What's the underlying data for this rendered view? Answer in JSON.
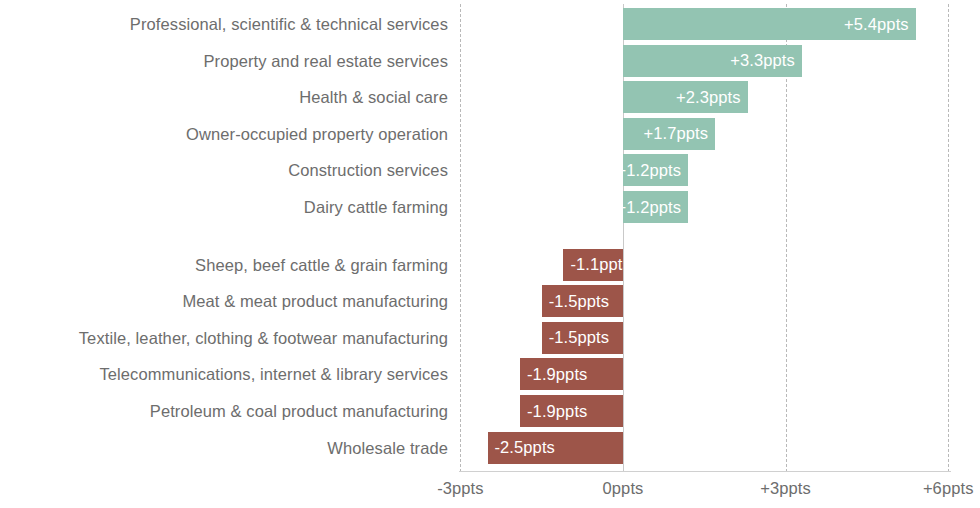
{
  "chart_data": {
    "type": "bar",
    "orientation": "horizontal",
    "title": "",
    "subtitle": "",
    "xlabel": "",
    "ylabel": "",
    "xlim": [
      -3.6,
      6.6
    ],
    "grid": true,
    "gridlines_style": "dashed",
    "legend": "none",
    "units": "ppts",
    "value_label_format": "{+}{v}ppts",
    "axis_ticks": [
      {
        "value": -3,
        "label": "-3ppts"
      },
      {
        "value": 0,
        "label": "0ppts"
      },
      {
        "value": 3,
        "label": "+3ppts"
      },
      {
        "value": 6,
        "label": "+6ppts"
      }
    ],
    "groups": [
      {
        "name": "positive",
        "color": "#93c4b2",
        "items": [
          {
            "category": "Professional, scientific & technical services",
            "value": 5.4,
            "label": "+5.4ppts"
          },
          {
            "category": "Property and real estate services",
            "value": 3.3,
            "label": "+3.3ppts"
          },
          {
            "category": "Health & social care",
            "value": 2.3,
            "label": "+2.3ppts"
          },
          {
            "category": "Owner-occupied property operation",
            "value": 1.7,
            "label": "+1.7ppts"
          },
          {
            "category": "Construction services",
            "value": 1.2,
            "label": "+1.2ppts"
          },
          {
            "category": "Dairy cattle farming",
            "value": 1.2,
            "label": "+1.2ppts"
          }
        ]
      },
      {
        "name": "negative",
        "color": "#9d5549",
        "items": [
          {
            "category": "Sheep, beef cattle & grain farming",
            "value": -1.1,
            "label": "-1.1ppts"
          },
          {
            "category": "Meat & meat product manufacturing",
            "value": -1.5,
            "label": "-1.5ppts"
          },
          {
            "category": "Textile, leather, clothing & footwear manufacturing",
            "value": -1.5,
            "label": "-1.5ppts"
          },
          {
            "category": "Telecommunications, internet & library services",
            "value": -1.9,
            "label": "-1.9ppts"
          },
          {
            "category": "Petroleum & coal product manufacturing",
            "value": -1.9,
            "label": "-1.9ppts"
          },
          {
            "category": "Wholesale trade",
            "value": -2.5,
            "label": "-2.5ppts"
          }
        ]
      }
    ],
    "categories": [
      "Professional, scientific & technical services",
      "Property and real estate services",
      "Health & social care",
      "Owner-occupied property operation",
      "Construction services",
      "Dairy cattle farming",
      "Sheep, beef cattle & grain farming",
      "Meat & meat product manufacturing",
      "Textile, leather, clothing & footwear manufacturing",
      "Telecommunications, internet & library services",
      "Petroleum & coal product manufacturing",
      "Wholesale trade"
    ],
    "values": [
      5.4,
      3.3,
      2.3,
      1.7,
      1.2,
      1.2,
      -1.1,
      -1.5,
      -1.5,
      -1.9,
      -1.9,
      -2.5
    ]
  },
  "colors": {
    "positive_bar": "#93c4b2",
    "negative_bar": "#9d5549",
    "value_text": "#ffffff",
    "category_text": "#6d6d6d",
    "tick_text": "#6d6d6d",
    "gridline": "#b9b9b9",
    "zero_line": "#c9c9c9",
    "background": "#ffffff"
  }
}
